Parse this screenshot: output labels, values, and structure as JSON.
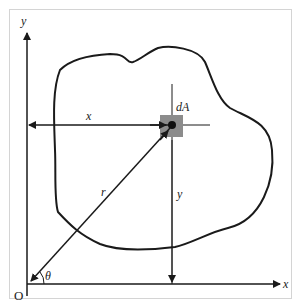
{
  "diagram": {
    "type": "area-element-coordinates",
    "labels": {
      "y_axis": "y",
      "x_axis": "x",
      "origin": "O",
      "element": "dA",
      "x_distance": "x",
      "y_distance": "y",
      "radius": "r",
      "angle": "θ"
    },
    "colors": {
      "line": "#1a1a1a",
      "element_fill": "#8c8c8c",
      "frame": "#d4d4d4"
    }
  }
}
